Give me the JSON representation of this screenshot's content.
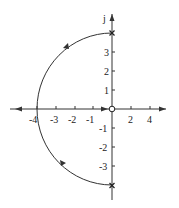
{
  "diagram": {
    "type": "root-locus",
    "imag_axis_label": "j",
    "x_tick_labels": [
      "-4",
      "-3",
      "-2",
      "-1",
      "2",
      "4"
    ],
    "y_tick_labels_pos": [
      "3",
      "2",
      "1"
    ],
    "y_tick_labels_neg": [
      "-1",
      "-2",
      "-3"
    ],
    "poles": [
      {
        "re": 0,
        "im": 4
      },
      {
        "re": 0,
        "im": -4
      }
    ],
    "zeros": [
      {
        "re": 0,
        "im": 0
      }
    ],
    "locus": "semicircle of radius 4 centered at origin in left half-plane, then real axis from -4 to -inf and -4 to 0",
    "colors": {
      "line": "#333333"
    }
  }
}
